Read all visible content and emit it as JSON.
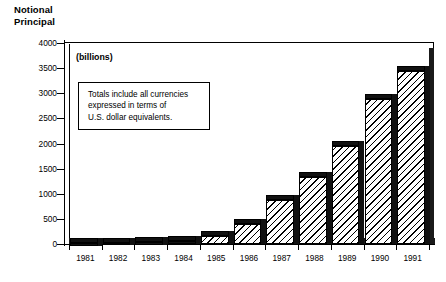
{
  "chart_data": {
    "type": "bar",
    "subtitle": "(billions)",
    "xlabel": "",
    "ylabel": "Notional Principal",
    "categories": [
      "1981",
      "1982",
      "1983",
      "1984",
      "1985",
      "1986",
      "1987",
      "1988",
      "1989",
      "1990",
      "1991"
    ],
    "values": [
      10,
      20,
      30,
      60,
      160,
      400,
      870,
      1330,
      1950,
      2890,
      3450
    ],
    "series": [
      {
        "name": "Notional Principal",
        "values": [
          10,
          20,
          30,
          60,
          160,
          400,
          870,
          1330,
          1950,
          2890,
          3450
        ]
      }
    ],
    "ylim": [
      0,
      4000
    ],
    "ytick_values": [
      0,
      500,
      1000,
      1500,
      2000,
      2500,
      3000,
      3500,
      4000
    ],
    "ytick_labels": [
      "0",
      "500",
      "1000",
      "1500",
      "2000",
      "2500",
      "3000",
      "3500",
      "4000"
    ],
    "grid": false,
    "legend": false,
    "legend_position": "none",
    "units_note": "(billions)",
    "annotation": "Totals include all currencies\nexpressed in terms of\nU.S. dollar equivalents.",
    "bar_style": "hatched-3d",
    "colors": {
      "bar_fill": "#ffffff",
      "bar_hatch": "#000000",
      "bar_edge": "#000000",
      "bar_shadow": "#111111",
      "axis": "#000000",
      "background": "#ffffff"
    }
  },
  "axis_title": {
    "line1": "Notional",
    "line2": "Principal"
  }
}
